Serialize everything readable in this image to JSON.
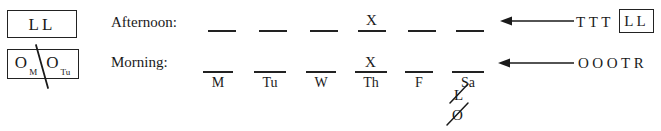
{
  "figure": {
    "type": "scheduling-worksheet"
  },
  "legend": {
    "afternoon_box": {
      "name": "afternoon-legend-box",
      "tokens": [
        {
          "letter": "L",
          "subscript": ""
        },
        {
          "letter": "L",
          "subscript": ""
        }
      ],
      "struck": false
    },
    "morning_box": {
      "name": "morning-legend-box",
      "tokens": [
        {
          "letter": "O",
          "subscript": "M"
        },
        {
          "letter": "O",
          "subscript": "Tu"
        }
      ],
      "struck": true,
      "strike_style": "diagonal-slash"
    }
  },
  "rows": [
    {
      "id": "afternoon",
      "label": "Afternoon:",
      "blanks": [
        {
          "day": "M",
          "value": ""
        },
        {
          "day": "Tu",
          "value": ""
        },
        {
          "day": "W",
          "value": ""
        },
        {
          "day": "Th",
          "value": "X"
        },
        {
          "day": "F",
          "value": ""
        },
        {
          "day": "Sa",
          "value": ""
        }
      ],
      "show_day_labels": false,
      "arrow": {
        "name": "afternoon-arrow",
        "direction": "left"
      },
      "pool": {
        "loose_tokens": [
          "T",
          "T",
          "T"
        ],
        "boxed_tokens": [
          "L",
          "L"
        ]
      }
    },
    {
      "id": "morning",
      "label": "Morning:",
      "blanks": [
        {
          "day": "M",
          "value": ""
        },
        {
          "day": "Tu",
          "value": ""
        },
        {
          "day": "W",
          "value": ""
        },
        {
          "day": "Th",
          "value": "X"
        },
        {
          "day": "F",
          "value": ""
        },
        {
          "day": "Sa",
          "value": ""
        }
      ],
      "show_day_labels": true,
      "arrow": {
        "name": "morning-arrow",
        "direction": "left"
      },
      "pool": {
        "loose_tokens": [
          "O",
          "O",
          "O",
          "T",
          "R"
        ],
        "boxed_tokens": []
      }
    }
  ],
  "scratch_marks": [
    {
      "glyph": "L",
      "struck": true,
      "under": "Sa"
    },
    {
      "glyph": "O",
      "struck": true,
      "under": "Sa"
    }
  ],
  "day_labels": [
    "M",
    "Tu",
    "W",
    "Th",
    "F",
    "Sa"
  ],
  "colors": {
    "ink": "#1a1a1a",
    "rule": "#222222",
    "background": "#ffffff"
  }
}
